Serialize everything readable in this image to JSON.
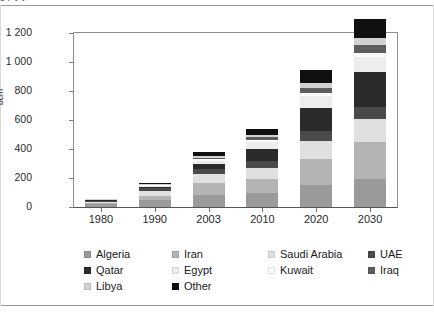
{
  "figure": {
    "caption_fragment": "g            p        y      y",
    "ylabel": "bcm"
  },
  "chart_data": {
    "type": "bar",
    "stacked": true,
    "title": "",
    "xlabel": "",
    "ylabel": "bcm",
    "ylim": [
      0,
      1200
    ],
    "yticks": [
      0,
      200,
      400,
      600,
      800,
      1000,
      1200
    ],
    "ytick_labels": [
      "0",
      "200",
      "400",
      "600",
      "800",
      "1 000",
      "1 200"
    ],
    "grid": false,
    "legend_position": "bottom",
    "categories": [
      "1980",
      "1990",
      "2003",
      "2010",
      "2020",
      "2030"
    ],
    "series": [
      {
        "name": "Algeria",
        "color": "#9a9a9a",
        "values": [
          20,
          50,
          85,
          95,
          150,
          195
        ]
      },
      {
        "name": "Iran",
        "color": "#b4b4b4",
        "values": [
          8,
          25,
          80,
          100,
          180,
          250
        ]
      },
      {
        "name": "Saudi Arabia",
        "color": "#e0e0e0",
        "values": [
          10,
          35,
          60,
          75,
          125,
          160
        ]
      },
      {
        "name": "UAE",
        "color": "#4a4a4a",
        "values": [
          6,
          18,
          35,
          45,
          70,
          85
        ]
      },
      {
        "name": "Qatar",
        "color": "#2b2b2b",
        "values": [
          2,
          8,
          35,
          85,
          155,
          240
        ]
      },
      {
        "name": "Egypt",
        "color": "#ededed",
        "values": [
          2,
          8,
          25,
          50,
          85,
          105
        ]
      },
      {
        "name": "Kuwait",
        "color": "#fbfbfb",
        "values": [
          2,
          5,
          10,
          14,
          22,
          28
        ]
      },
      {
        "name": "Iraq",
        "color": "#5e5e5e",
        "values": [
          1,
          3,
          10,
          16,
          35,
          55
        ]
      },
      {
        "name": "Libya",
        "color": "#d2d2d2",
        "values": [
          2,
          5,
          12,
          18,
          32,
          45
        ]
      },
      {
        "name": "Other",
        "color": "#101010",
        "values": [
          2,
          8,
          25,
          42,
          90,
          135
        ]
      }
    ],
    "totals": [
      55,
      165,
      377,
      540,
      944,
      1298
    ]
  },
  "legend": {
    "rows": [
      [
        {
          "label": "Algeria",
          "color": "#9a9a9a"
        },
        {
          "label": "Iran",
          "color": "#b4b4b4"
        },
        {
          "label": "Saudi Arabia",
          "color": "#e0e0e0"
        },
        {
          "label": "UAE",
          "color": "#4a4a4a"
        }
      ],
      [
        {
          "label": "Qatar",
          "color": "#2b2b2b"
        },
        {
          "label": "Egypt",
          "color": "#ededed"
        },
        {
          "label": "Kuwait",
          "color": "#fbfbfb"
        },
        {
          "label": "Iraq",
          "color": "#5e5e5e"
        }
      ],
      [
        {
          "label": "Libya",
          "color": "#d2d2d2"
        },
        {
          "label": "Other",
          "color": "#101010"
        }
      ]
    ]
  }
}
